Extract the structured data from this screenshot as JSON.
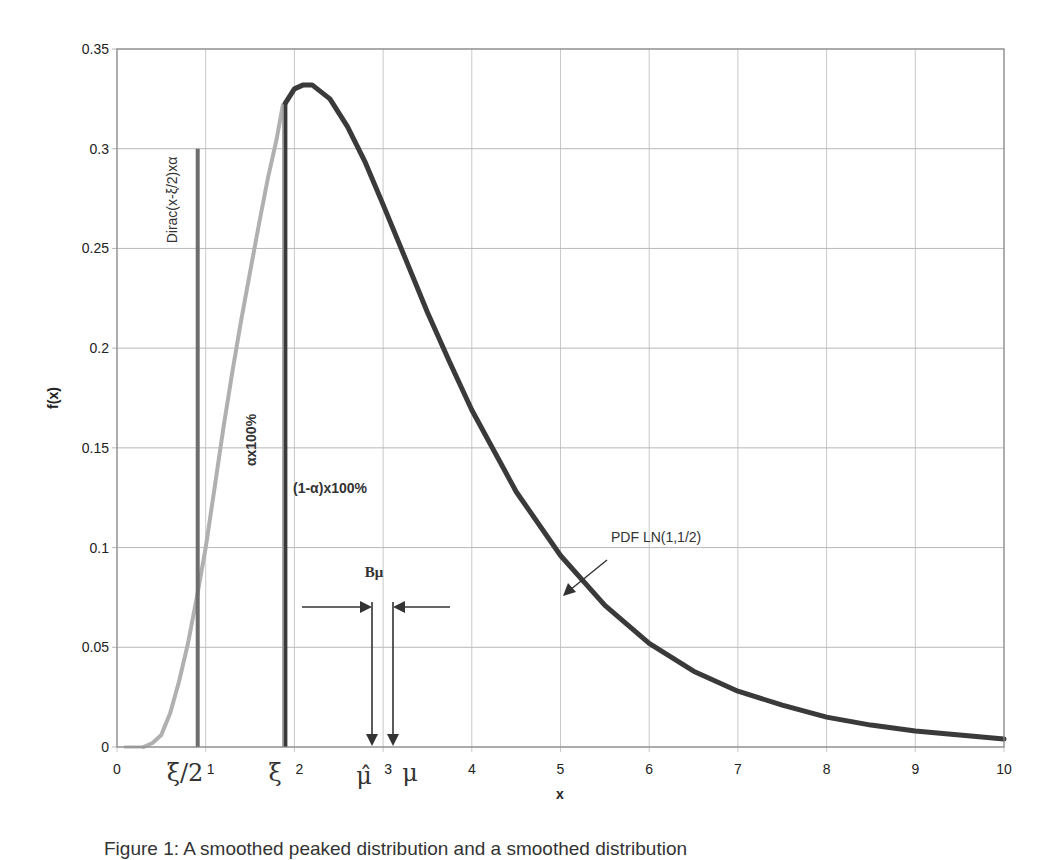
{
  "chart_data": {
    "type": "line",
    "title": "",
    "xlabel": "x",
    "ylabel": "f(x)",
    "xlim": [
      0,
      10
    ],
    "ylim": [
      0,
      0.35
    ],
    "grid": true,
    "x_ticks": [
      "0",
      "1",
      "2",
      "3",
      "4",
      "5",
      "6",
      "7",
      "8",
      "9",
      "10"
    ],
    "y_ticks": [
      "0",
      "0.05",
      "0.1",
      "0.15",
      "0.2",
      "0.25",
      "0.3",
      "0.35"
    ],
    "series": [
      {
        "name": "PDF LN(1,1/2) (right part)",
        "color": "#3a3a3a",
        "x": [
          1.9,
          2.0,
          2.1,
          2.2,
          2.4,
          2.6,
          2.8,
          3.0,
          3.25,
          3.5,
          3.75,
          4.0,
          4.5,
          5.0,
          5.5,
          6.0,
          6.5,
          7.0,
          7.5,
          8.0,
          8.5,
          9.0,
          9.5,
          10.0
        ],
        "y": [
          0.323,
          0.33,
          0.332,
          0.332,
          0.325,
          0.311,
          0.293,
          0.272,
          0.245,
          0.218,
          0.193,
          0.169,
          0.128,
          0.096,
          0.071,
          0.052,
          0.038,
          0.028,
          0.021,
          0.015,
          0.011,
          0.008,
          0.006,
          0.004
        ]
      },
      {
        "name": "smoothed left part (light)",
        "color": "#b0b0b0",
        "x": [
          0.3,
          0.4,
          0.5,
          0.6,
          0.7,
          0.8,
          0.9,
          1.0,
          1.1,
          1.2,
          1.3,
          1.4,
          1.5,
          1.6,
          1.7,
          1.8,
          1.87
        ],
        "y": [
          0.0,
          0.002,
          0.006,
          0.017,
          0.033,
          0.052,
          0.075,
          0.1,
          0.13,
          0.16,
          0.188,
          0.214,
          0.238,
          0.262,
          0.285,
          0.305,
          0.322
        ]
      }
    ],
    "vlines": [
      {
        "name": "Dirac(x-ξ/2)xα",
        "x": 0.91,
        "y_top": 0.3,
        "color": "#6e6e6e"
      },
      {
        "name": "ξ",
        "x": 1.89,
        "y_top": 0.323,
        "color": "#3a3a3a"
      },
      {
        "name": "mu-hat marker",
        "x": 2.87,
        "y_top": 0.061,
        "color": "#333"
      },
      {
        "name": "mu marker",
        "x": 3.11,
        "y_top": 0.061,
        "color": "#333"
      }
    ],
    "annotations": {
      "dirac_label": "Dirac(x-ξ/2)xα",
      "alpha_label": "αx100%",
      "one_minus_alpha_label": "(1-α)x100%",
      "bias_label": "Bμ",
      "pdf_label": "PDF LN(1,1/2)",
      "xi_half": "ξ/2",
      "xi": "ξ",
      "mu_hat": "μ̂",
      "mu": "μ"
    }
  },
  "caption": "Figure 1: A smoothed peaked distribution and a smoothed distribution"
}
